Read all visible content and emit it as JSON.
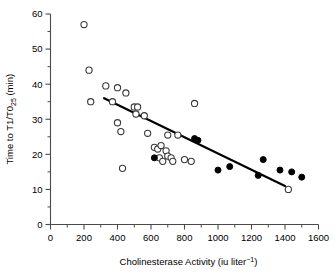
{
  "figure": {
    "background": "#ffffff",
    "axis_color": "#4a4a4a",
    "line_color": "#000000",
    "open_marker_color": "#ffffff",
    "filled_marker_color": "#000000"
  },
  "axes": {
    "x": {
      "label_main": "Cholinesterase Activity (iu liter",
      "label_sup": "−1",
      "label_tail": ")",
      "label_full": "Cholinesterase Activity (iu liter⁻¹)",
      "min": 0,
      "max": 1600,
      "ticks": [
        0,
        200,
        400,
        600,
        800,
        1000,
        1200,
        1400,
        1600
      ],
      "tick_labels": [
        "0",
        "200",
        "400",
        "600",
        "800",
        "1000",
        "1200",
        "1400",
        "1600"
      ],
      "minor_step": 100
    },
    "y": {
      "label_pre": "Time to T1/T0",
      "label_sub": "25",
      "label_post": " (min)",
      "label_full": "Time to T1/T0₂₅ (min)",
      "min": 0,
      "max": 60,
      "ticks": [
        0,
        10,
        20,
        30,
        40,
        50,
        60
      ],
      "tick_labels": [
        "0",
        "10",
        "20",
        "30",
        "40",
        "50",
        "60"
      ],
      "minor_step": 5
    }
  },
  "chart_data": {
    "type": "scatter",
    "title": "",
    "xlabel": "Cholinesterase Activity (iu liter⁻¹)",
    "ylabel": "Time to T1/T0₂₅ (min)",
    "xlim": [
      0,
      1600
    ],
    "ylim": [
      0,
      60
    ],
    "grid": false,
    "legend": "none",
    "series": [
      {
        "name": "open-circles",
        "marker": "open-circle",
        "color": "#ffffff",
        "edge_color": "#3a3a3a",
        "points": [
          [
            200,
            57.0
          ],
          [
            230,
            44.0
          ],
          [
            240,
            35.0
          ],
          [
            330,
            39.5
          ],
          [
            370,
            35.0
          ],
          [
            400,
            39.0
          ],
          [
            400,
            29.0
          ],
          [
            420,
            26.5
          ],
          [
            430,
            16.0
          ],
          [
            450,
            37.5
          ],
          [
            500,
            33.5
          ],
          [
            510,
            31.5
          ],
          [
            520,
            33.5
          ],
          [
            560,
            31.0
          ],
          [
            580,
            26.0
          ],
          [
            620,
            22.0
          ],
          [
            640,
            21.5
          ],
          [
            650,
            19.0
          ],
          [
            660,
            22.5
          ],
          [
            670,
            18.0
          ],
          [
            690,
            21.0
          ],
          [
            700,
            19.5
          ],
          [
            700,
            25.5
          ],
          [
            720,
            19.0
          ],
          [
            730,
            18.0
          ],
          [
            760,
            25.5
          ],
          [
            800,
            18.5
          ],
          [
            840,
            18.0
          ],
          [
            860,
            34.5
          ],
          [
            1420,
            10.0
          ]
        ]
      },
      {
        "name": "filled-circles",
        "marker": "filled-circle",
        "color": "#000000",
        "points": [
          [
            620,
            19.0
          ],
          [
            860,
            24.5
          ],
          [
            880,
            24.0
          ],
          [
            1000,
            15.5
          ],
          [
            1070,
            16.5
          ],
          [
            1240,
            14.0
          ],
          [
            1270,
            18.5
          ],
          [
            1370,
            15.5
          ],
          [
            1440,
            15.0
          ],
          [
            1500,
            13.5
          ]
        ]
      }
    ],
    "fit_line": {
      "name": "regression-line",
      "x_start": 320,
      "y_start": 36.0,
      "x_end": 1400,
      "y_end": 11.0
    }
  }
}
